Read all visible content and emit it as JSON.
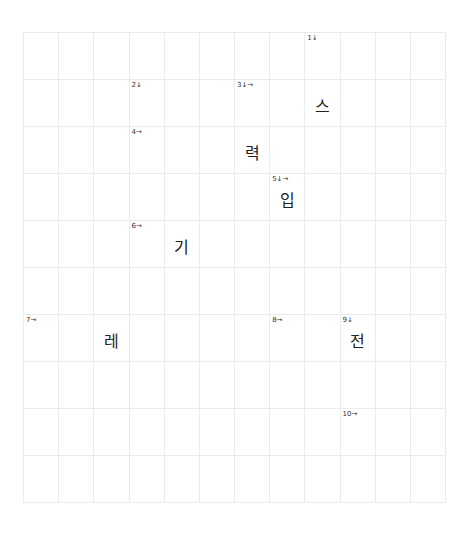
{
  "puzzle": {
    "rows": 10,
    "cols": 12,
    "clue_numbers": [
      {
        "id": "c1",
        "label": "1↓",
        "row": 0,
        "col": 8
      },
      {
        "id": "c2",
        "label": "2↓",
        "row": 1,
        "col": 3
      },
      {
        "id": "c3",
        "label": "3↓→",
        "row": 1,
        "col": 6
      },
      {
        "id": "c4",
        "label": "4→",
        "row": 2,
        "col": 3
      },
      {
        "id": "c5",
        "label": "5↓→",
        "row": 3,
        "col": 7
      },
      {
        "id": "c6",
        "label": "6→",
        "row": 4,
        "col": 3
      },
      {
        "id": "c7",
        "label": "7→",
        "row": 6,
        "col": 0
      },
      {
        "id": "c8",
        "label": "8→",
        "row": 6,
        "col": 7
      },
      {
        "id": "c9",
        "label": "9↓",
        "row": 6,
        "col": 9
      },
      {
        "id": "c10",
        "label": "10→",
        "row": 8,
        "col": 9
      }
    ],
    "letters": [
      {
        "char": "스",
        "row": 1,
        "col": 8
      },
      {
        "char": "력",
        "row": 2,
        "col": 6
      },
      {
        "char": "입",
        "row": 3,
        "col": 7
      },
      {
        "char": "기",
        "row": 4,
        "col": 4
      },
      {
        "char": "레",
        "row": 6,
        "col": 2
      },
      {
        "char": "전",
        "row": 6,
        "col": 9
      }
    ]
  },
  "colors": {
    "grid_line": "#ebebeb",
    "text": "#222222",
    "background": "#ffffff"
  }
}
